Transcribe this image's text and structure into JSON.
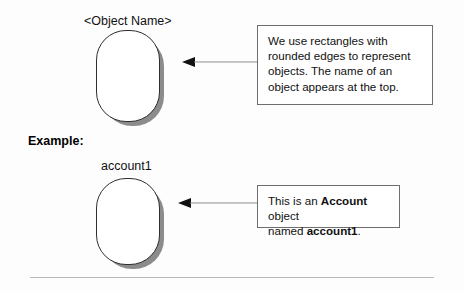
{
  "figure": {
    "background_color": "#fdfdfd",
    "shape_border_color": "#2e2e2e",
    "shape_shadow_color": "#8c8c8c",
    "callout_border_color": "#6e6e6e",
    "arrow_color": "#111111",
    "divider_color": "#b9b9b9"
  },
  "generic": {
    "object_label": "<Object Name>",
    "callout_text": "We use rectangles with rounded edges to represent objects. The name of an object appears at the top."
  },
  "example": {
    "heading": "Example:",
    "object_label": "account1",
    "callout": {
      "line1_prefix": "This is an ",
      "line1_bold": "Account",
      "line1_suffix": " object",
      "line2_prefix": "named ",
      "line2_bold": "account1",
      "line2_suffix": "."
    }
  }
}
